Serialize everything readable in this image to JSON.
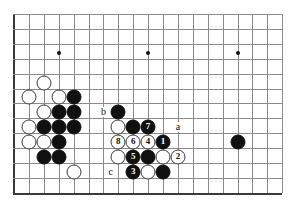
{
  "diagram": {
    "kind": "go-board-diagram",
    "board": {
      "width": 293,
      "height": 204,
      "origin_x": 14,
      "origin_y": 14,
      "spacing": 14.9,
      "cols": 19,
      "rows": 13,
      "line_color": "#8a8a8a",
      "edge_color": "#3a3a3a",
      "background": "#ffffff",
      "edges": {
        "left": true,
        "right": false,
        "top": false,
        "bottom": true
      },
      "star_points": [
        {
          "col": 3,
          "row": 2.6
        },
        {
          "col": 9,
          "row": 2.6
        },
        {
          "col": 15,
          "row": 2.6
        }
      ]
    },
    "stones": [
      {
        "col": 2,
        "row": 4.6,
        "color": "white",
        "label": ""
      },
      {
        "col": 3,
        "row": 5.6,
        "color": "white",
        "label": ""
      },
      {
        "col": 1,
        "row": 5.6,
        "color": "white",
        "label": ""
      },
      {
        "col": 4,
        "row": 5.6,
        "color": "black",
        "label": ""
      },
      {
        "col": 2,
        "row": 6.6,
        "color": "white",
        "label": ""
      },
      {
        "col": 3,
        "row": 6.6,
        "color": "black",
        "label": ""
      },
      {
        "col": 4,
        "row": 6.6,
        "color": "black",
        "label": ""
      },
      {
        "col": 1,
        "row": 7.6,
        "color": "white",
        "label": ""
      },
      {
        "col": 2,
        "row": 7.6,
        "color": "black",
        "label": ""
      },
      {
        "col": 3,
        "row": 7.6,
        "color": "black",
        "label": ""
      },
      {
        "col": 4,
        "row": 7.6,
        "color": "black",
        "label": ""
      },
      {
        "col": 1,
        "row": 8.6,
        "color": "white",
        "label": ""
      },
      {
        "col": 2,
        "row": 8.6,
        "color": "white",
        "label": ""
      },
      {
        "col": 3,
        "row": 8.6,
        "color": "black",
        "label": ""
      },
      {
        "col": 2,
        "row": 9.6,
        "color": "black",
        "label": ""
      },
      {
        "col": 3,
        "row": 9.6,
        "color": "black",
        "label": ""
      },
      {
        "col": 4,
        "row": 10.6,
        "color": "white",
        "label": ""
      },
      {
        "col": 7,
        "row": 6.6,
        "color": "black",
        "label": ""
      },
      {
        "col": 7,
        "row": 7.6,
        "color": "white",
        "label": ""
      },
      {
        "col": 8,
        "row": 7.6,
        "color": "black",
        "label": ""
      },
      {
        "col": 9,
        "row": 7.6,
        "color": "black",
        "label": "7"
      },
      {
        "col": 7,
        "row": 8.6,
        "color": "white",
        "label": "8"
      },
      {
        "col": 8,
        "row": 8.6,
        "color": "white",
        "label": "6"
      },
      {
        "col": 9,
        "row": 8.6,
        "color": "white",
        "label": "4"
      },
      {
        "col": 10,
        "row": 8.6,
        "color": "black",
        "label": "1"
      },
      {
        "col": 7,
        "row": 9.6,
        "color": "white",
        "label": ""
      },
      {
        "col": 8,
        "row": 9.6,
        "color": "black",
        "label": "5"
      },
      {
        "col": 9,
        "row": 9.6,
        "color": "black",
        "label": ""
      },
      {
        "col": 10,
        "row": 9.6,
        "color": "white",
        "label": ""
      },
      {
        "col": 11,
        "row": 9.6,
        "color": "white",
        "label": "2"
      },
      {
        "col": 8,
        "row": 10.6,
        "color": "black",
        "label": "3"
      },
      {
        "col": 9,
        "row": 10.6,
        "color": "white",
        "label": ""
      },
      {
        "col": 10,
        "row": 10.6,
        "color": "black",
        "label": ""
      },
      {
        "col": 15,
        "row": 8.6,
        "color": "black",
        "label": ""
      }
    ],
    "point_labels": [
      {
        "text": "a",
        "col": 11,
        "row": 7.6
      },
      {
        "text": "b",
        "col": 6,
        "row": 6.6
      },
      {
        "text": "c",
        "col": 6.5,
        "row": 10.6
      }
    ]
  }
}
